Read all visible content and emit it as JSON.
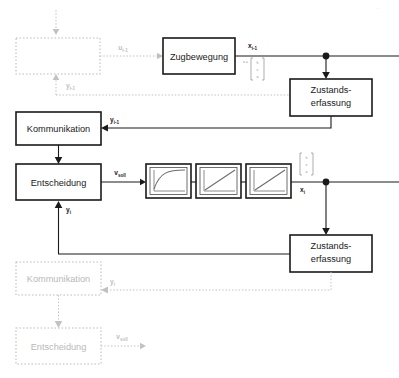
{
  "diagram": {
    "corner_mark": "··"
  },
  "colors": {
    "line": "#1a1a1a",
    "ghost": "#c2c2c2",
    "curve": "#6e6e6e",
    "background": "#ffffff"
  },
  "blocks": {
    "zugbewegung": {
      "label": "Zugbewegung"
    },
    "zustandserfassung_top": {
      "label_line1": "Zustands-",
      "label_line2": "erfassung"
    },
    "zustandserfassung_bottom": {
      "label_line1": "Zustands-",
      "label_line2": "erfassung"
    },
    "kommunikation": {
      "label": "Kommunikation"
    },
    "entscheidung": {
      "label": "Entscheidung"
    },
    "ghost_top": {
      "label": ""
    },
    "ghost_kommunikation": {
      "label": "Kommunikation"
    },
    "ghost_entscheidung": {
      "label": "Entscheidung"
    }
  },
  "curve_blocks": [
    {
      "name": "saturating-rise",
      "shape": "exponential-saturation"
    },
    {
      "name": "linear-ramp-1",
      "shape": "linear"
    },
    {
      "name": "linear-ramp-2",
      "shape": "linear"
    }
  ],
  "signals": {
    "u_prev": {
      "base": "u",
      "sub": "i-1"
    },
    "x_prev": {
      "base": "x",
      "sub": "i-1"
    },
    "y_prev": {
      "base": "y",
      "sub": "i-1"
    },
    "y_prev_ghost": {
      "base": "y",
      "sub": "i-1"
    },
    "y_kom": {
      "base": "y",
      "sub": "i-1"
    },
    "v_soll": {
      "base": "v",
      "sub": "soll"
    },
    "x_i": {
      "base": "x",
      "sub": "i"
    },
    "y_i": {
      "base": "y",
      "sub": "i"
    },
    "y_i_ghost": {
      "base": "y",
      "sub": "i"
    },
    "v_soll_ghost": {
      "base": "v",
      "sub": "soll"
    }
  },
  "state_vector_top": {
    "lhs": "x =",
    "elements": [
      "h",
      "v",
      "a"
    ]
  },
  "state_vector_bottom": {
    "elements": [
      "h",
      "v",
      "a"
    ]
  }
}
